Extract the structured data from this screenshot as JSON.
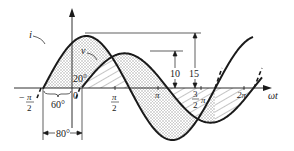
{
  "diagram": {
    "axis": {
      "horizontal_label": "ωt",
      "origin_label": "0",
      "ticks": [
        {
          "label_top": "π",
          "label_bottom": "2",
          "prefix": "−",
          "name": "minus-pi-over-2"
        },
        {
          "label_top": "π",
          "label_bottom": "2",
          "prefix": "",
          "name": "pi-over-2"
        },
        {
          "label": "π",
          "name": "pi"
        },
        {
          "label_top": "3",
          "label_bottom": "2",
          "suffix": "π",
          "name": "three-pi-over-2"
        },
        {
          "label": "2π",
          "name": "two-pi"
        }
      ]
    },
    "curves": [
      {
        "name": "current",
        "label": "i",
        "amplitude": 15,
        "phase_deg": 60,
        "fill": "stippled"
      },
      {
        "name": "voltage",
        "label": "v",
        "amplitude": 10,
        "phase_deg": -20,
        "fill": "hatched"
      }
    ],
    "annotations": {
      "angle_i": "60°",
      "angle_v": "20°",
      "phase_difference": "80°",
      "amp_v": "10",
      "amp_i": "15"
    },
    "colors": {
      "line": "#1a1a1a",
      "stipple": "#b5b5b5"
    }
  }
}
